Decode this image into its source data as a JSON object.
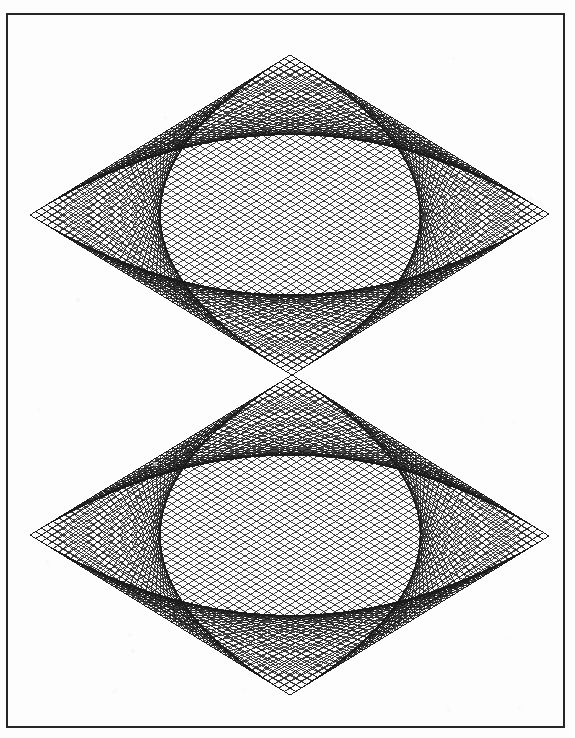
{
  "canvas": {
    "width": 575,
    "height": 738,
    "background_color": "#fdfdfd",
    "ink_color": "#1a1a1a"
  },
  "frame": {
    "label": "image-border",
    "x": 6,
    "y": 13,
    "width": 559,
    "height": 715,
    "stroke_color": "#262626",
    "stroke_width": 2
  },
  "figure": {
    "center_touch_point": {
      "x": 292,
      "y": 375
    },
    "line_color": "#1a1a1a",
    "line_width": 0.85,
    "lines_per_family": 46
  },
  "chart_data": {
    "type": "line",
    "subtitle": "",
    "xlabel": "",
    "ylabel": "",
    "grid": false,
    "legend": "none",
    "xlim": [
      0,
      575
    ],
    "ylim": [
      0,
      738
    ],
    "series": [
      {
        "name": "upper-rhombus",
        "vertices": {
          "left": {
            "x": 30,
            "y": 215
          },
          "top": {
            "x": 290,
            "y": 55
          },
          "right": {
            "x": 549,
            "y": 214
          },
          "bottom": {
            "x": 292,
            "y": 375
          }
        },
        "n_chords": 46,
        "families": [
          "left-top",
          "top-right",
          "right-bottom",
          "bottom-left"
        ]
      },
      {
        "name": "lower-rhombus",
        "vertices": {
          "left": {
            "x": 30,
            "y": 535
          },
          "top": {
            "x": 292,
            "y": 375
          },
          "right": {
            "x": 549,
            "y": 536
          },
          "bottom": {
            "x": 290,
            "y": 695
          }
        },
        "n_chords": 46,
        "families": [
          "left-top",
          "top-right",
          "right-bottom",
          "bottom-left"
        ]
      }
    ]
  }
}
